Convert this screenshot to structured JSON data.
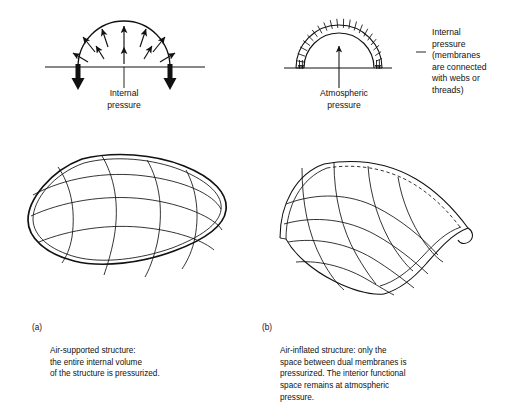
{
  "document": {
    "title": "Air-supported versus air-inflated membrane structures",
    "background_color": "#ffffff",
    "ink_color": "#111111"
  },
  "panel_a": {
    "id": "panel-a",
    "section_diagram": {
      "name": "air-supported-arch-section",
      "description": "Single membrane arch over ground line with internal pressure arrows pushing outward and two heavy anchor arrows pointing down",
      "arrow_count_radial": 9,
      "anchor_arrow_count": 2,
      "membrane_count": 1
    },
    "label": {
      "text": "Internal\npressure",
      "lines": [
        "Internal",
        "pressure"
      ]
    },
    "perspective_figure": {
      "name": "air-supported-pillow-dome",
      "description": "Rounded pillow shaped single membrane dome with seam grid",
      "longitudinal_seams": 3,
      "transverse_seams": 4
    },
    "caption": {
      "tag": "(a)",
      "text": "Air-supported structure:\nthe entire internal volume\nof the structure is pressurized.",
      "lines": [
        "Air-supported structure:",
        "the entire internal volume",
        "of the structure is pressurized."
      ]
    }
  },
  "panel_b": {
    "id": "panel-b",
    "section_diagram": {
      "name": "air-inflated-arch-section",
      "description": "Dual membrane arch with radial webs between inner and outer arcs, atmospheric pressure arrow rising inside the interior space",
      "web_count": 22,
      "membrane_count": 2,
      "inward_arrow_pairs": 2
    },
    "label_center": {
      "text": "Atmospheric\npressure",
      "lines": [
        "Atmospheric",
        "pressure"
      ]
    },
    "label_right": {
      "text": "Internal\npressure\n(membranes\nare connected\nwith webs or\nthreads)",
      "lines": [
        "Internal",
        "pressure",
        "(membranes",
        "are connected",
        "with webs or",
        "threads)"
      ]
    },
    "perspective_figure": {
      "name": "air-inflated-barrel-vault",
      "description": "Barrel vault of dual membranes with cut-away peeled edge showing membrane thickness and dashed hidden ridge line",
      "longitudinal_seams": 4,
      "transverse_seams": 4,
      "has_cutaway": true,
      "has_hidden_dashed_line": true
    },
    "caption": {
      "tag": "(b)",
      "text": "Air-inflated structure: only the\nspace between dual membranes is\npressurized. The interior functional\nspace remains at atmospheric\npressure.",
      "lines": [
        "Air-inflated structure: only the",
        "space between dual membranes is",
        "pressurized. The interior functional",
        "space remains at atmospheric",
        "pressure."
      ]
    }
  }
}
